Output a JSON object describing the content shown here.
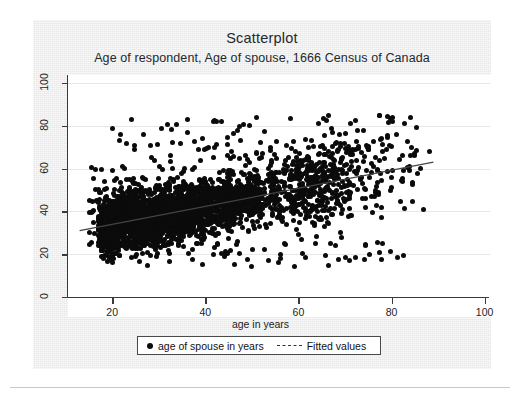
{
  "figure": {
    "title": "Scatterplot",
    "subtitle": "Age of respondent, Age of spouse, 1666 Census of Canada",
    "background_color": "#e8e8e8",
    "plot_background_color": "#ffffff",
    "point_color": "#0b0b0b",
    "fit_line_color": "#444444"
  },
  "legend": {
    "items": [
      {
        "marker": "filled-circle",
        "label": "age of spouse in years"
      },
      {
        "marker": "dashed-line",
        "label": "Fitted values"
      }
    ]
  },
  "chart_data": {
    "type": "scatter",
    "title": "Scatterplot",
    "subtitle": "Age of respondent, Age of spouse, 1666 Census of Canada",
    "xlabel": "age in years",
    "ylabel": "",
    "xlim": [
      10,
      102
    ],
    "ylim": [
      0,
      104
    ],
    "xticks": [
      20,
      40,
      60,
      80,
      100
    ],
    "yticks": [
      0,
      20,
      40,
      60,
      80,
      100
    ],
    "grid": "horizontal-faint",
    "legend_position": "below-axes-center",
    "series": [
      {
        "name": "age of spouse in years",
        "type": "scatter",
        "marker": "filled-circle",
        "color": "#0b0b0b",
        "n_points_approx": 1900,
        "x_range": [
          13,
          88
        ],
        "y_range": [
          14,
          86
        ],
        "dense_core": {
          "x": [
            18,
            55
          ],
          "y": [
            26,
            62
          ]
        },
        "description": "Very dense near-solid black cloud of respondent age vs spouse age; thins out rapidly above x=60."
      },
      {
        "name": "Fitted values",
        "type": "line",
        "style": "thin-solid",
        "color": "#444444",
        "endpoints": [
          {
            "x": 13,
            "y": 31
          },
          {
            "x": 89,
            "y": 63
          }
        ],
        "slope_approx": 0.42,
        "intercept_approx": 25.5
      }
    ]
  }
}
